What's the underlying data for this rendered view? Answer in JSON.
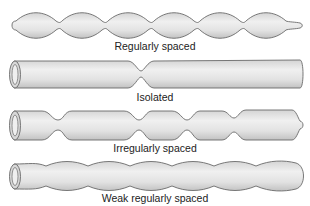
{
  "figure": {
    "rows": [
      {
        "id": "regular",
        "label": "Regularly spaced",
        "pattern": "beads",
        "bead_count": 7
      },
      {
        "id": "isolated",
        "label": "Isolated",
        "pattern": "single-constriction"
      },
      {
        "id": "irregular",
        "label": "Irregularly spaced",
        "pattern": "irregular-constrictions"
      },
      {
        "id": "weak",
        "label": "Weak regularly spaced",
        "pattern": "weak-undulation"
      }
    ],
    "colors": {
      "fill_light": "#ececec",
      "fill_dark": "#c9c9c9",
      "outline": "#6a6a6a",
      "label": "#222222"
    }
  }
}
